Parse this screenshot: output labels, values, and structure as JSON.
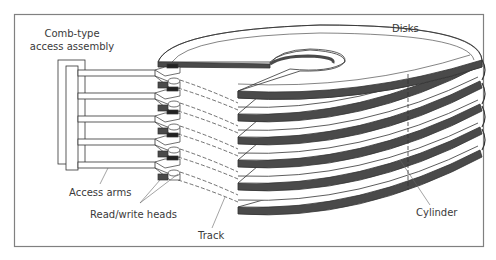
{
  "diagram": {
    "labels": {
      "assembly_line1": "Comb-type",
      "assembly_line2": "access assembly",
      "disks": "Disks",
      "access_arms": "Access arms",
      "read_write_heads": "Read/write heads",
      "track": "Track",
      "cylinder": "Cylinder"
    },
    "counts": {
      "disks": 6,
      "access_arms": 5
    },
    "colors": {
      "frame": "#808080",
      "ink": "#333333",
      "rim": "#4a4a4a",
      "background": "#ffffff"
    }
  }
}
